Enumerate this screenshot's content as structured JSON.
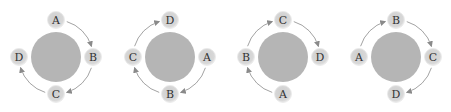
{
  "figure": {
    "colors": {
      "central_body": "#b5b5b5",
      "small_body": "#d6d6d6",
      "small_body_edge": "#e8e8e8",
      "arrow": "#8a8a8a",
      "label": "#333333"
    },
    "panels": [
      {
        "id": "panel-1",
        "center": [
          56,
          57
        ],
        "positions": {
          "top": "A",
          "right": "B",
          "bottom": "C",
          "left": "D"
        },
        "arrows": [
          "top-right",
          "right-bottom",
          "bottom-left"
        ]
      },
      {
        "id": "panel-2",
        "center": [
          170,
          57
        ],
        "positions": {
          "top": "D",
          "right": "A",
          "bottom": "B",
          "left": "C"
        },
        "arrows": [
          "right-bottom",
          "bottom-left",
          "left-top"
        ]
      },
      {
        "id": "panel-3",
        "center": [
          283,
          57
        ],
        "positions": {
          "top": "C",
          "right": "D",
          "bottom": "A",
          "left": "B"
        },
        "arrows": [
          "bottom-left",
          "left-top",
          "top-right"
        ]
      },
      {
        "id": "panel-4",
        "center": [
          396,
          57
        ],
        "positions": {
          "top": "B",
          "right": "C",
          "bottom": "D",
          "left": "A"
        },
        "arrows": [
          "left-top",
          "top-right",
          "right-bottom"
        ]
      }
    ]
  }
}
